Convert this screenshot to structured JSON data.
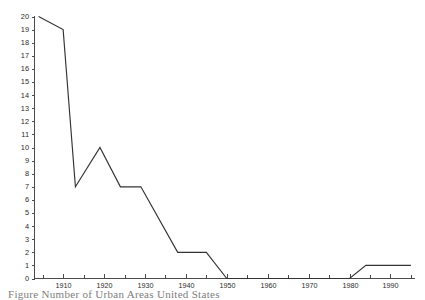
{
  "figure": {
    "caption": "Figure   Number of Urban  Areas   United States",
    "background_color": "#ffffff",
    "line_color": "#333333",
    "axis_color": "#4a4a4a"
  },
  "chart_data": {
    "type": "line",
    "title": "",
    "xlabel": "",
    "ylabel": "",
    "xlim": [
      1903,
      1996
    ],
    "ylim": [
      0,
      20
    ],
    "grid": false,
    "legend": null,
    "y_ticks": [
      0,
      1,
      2,
      3,
      4,
      5,
      6,
      7,
      8,
      9,
      10,
      11,
      12,
      13,
      14,
      15,
      16,
      17,
      18,
      19,
      20
    ],
    "y_tick_labels": [
      "0",
      "1",
      "2",
      "3",
      "4",
      "5",
      "6",
      "7",
      "8",
      "9",
      "10",
      "11",
      "12",
      "13",
      "14",
      "15",
      "16",
      "17",
      "18",
      "19",
      "20"
    ],
    "x_ticks_major": [
      1910,
      1920,
      1930,
      1940,
      1950,
      1960,
      1970,
      1980,
      1990
    ],
    "x_tick_labels": [
      "1910",
      "1920",
      "1930",
      "1940",
      "1950",
      "1960",
      "1970",
      "1980",
      "1990"
    ],
    "x_ticks_minor": [
      1905,
      1915,
      1925,
      1935,
      1945,
      1955,
      1965,
      1975,
      1985,
      1995
    ],
    "series": [
      {
        "name": "count",
        "x": [
          1904,
          1910,
          1913,
          1919,
          1924,
          1929,
          1938,
          1945,
          1950,
          1980,
          1984,
          1995
        ],
        "values": [
          20,
          19,
          7,
          10,
          7,
          7,
          2,
          2,
          0,
          0,
          1,
          1
        ]
      }
    ],
    "annotations": []
  }
}
